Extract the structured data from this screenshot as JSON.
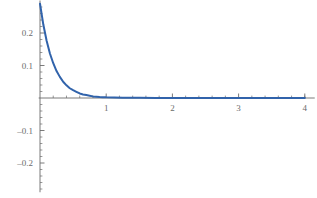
{
  "chart_data": {
    "type": "line",
    "title": "",
    "subtitle": "",
    "xlabel": "",
    "ylabel": "",
    "xlim": [
      -0.02,
      4.15
    ],
    "ylim": [
      -0.29,
      0.3
    ],
    "grid": false,
    "legend": null,
    "axis_style": "mathematica-crossed-axes",
    "series": [
      {
        "name": "exponential decay",
        "color": "#3163ab",
        "line_width": 2,
        "x": [
          0.0,
          0.05,
          0.1,
          0.15,
          0.2,
          0.25,
          0.3,
          0.35,
          0.4,
          0.45,
          0.5,
          0.55,
          0.6,
          0.65,
          0.7,
          0.75,
          0.8,
          0.85,
          0.9,
          0.95,
          1.0,
          1.25,
          1.5,
          1.75,
          2.0,
          2.25,
          2.5,
          2.75,
          3.0,
          3.25,
          3.5,
          3.75,
          4.0
        ],
        "y": [
          0.29,
          0.226,
          0.176,
          0.137,
          0.107,
          0.083,
          0.065,
          0.05,
          0.039,
          0.03,
          0.024,
          0.019,
          0.014,
          0.011,
          0.009,
          0.007,
          0.005,
          0.004,
          0.003,
          0.0025,
          0.002,
          0.001,
          0.0005,
          0.0002,
          0.0001,
          0.0001,
          0.0,
          0.0,
          0.0,
          0.0,
          0.0,
          0.0,
          0.0
        ]
      }
    ],
    "x_axis": {
      "major_ticks": [
        1,
        2,
        3,
        4
      ],
      "major_tick_labels": [
        "1",
        "2",
        "3",
        "4"
      ],
      "minor_ticks": [
        0.2,
        0.4,
        0.6,
        0.8,
        1.2,
        1.4,
        1.6,
        1.8,
        2.2,
        2.4,
        2.6,
        2.8,
        3.2,
        3.4,
        3.6,
        3.8,
        4.0
      ],
      "zero_label_shown": false
    },
    "y_axis": {
      "major_ticks": [
        -0.2,
        -0.1,
        0.1,
        0.2
      ],
      "major_tick_labels": [
        "-0.2",
        "-0.1",
        "0.1",
        "0.2"
      ],
      "minor_ticks": [
        -0.28,
        -0.26,
        -0.24,
        -0.22,
        -0.18,
        -0.16,
        -0.14,
        -0.12,
        -0.08,
        -0.06,
        -0.04,
        -0.02,
        0.02,
        0.04,
        0.06,
        0.08,
        0.12,
        0.14,
        0.16,
        0.18,
        0.22,
        0.24,
        0.26,
        0.28
      ],
      "zero_label_shown": false
    }
  },
  "colors": {
    "curve": "#3163ab",
    "axis": "#6b6b6b",
    "tick_label": "#6b6b6b",
    "background": "#ffffff"
  },
  "labels": {
    "y_02": "0.2",
    "y_01": "0.1",
    "y_m01": "-0.1",
    "y_m02": "-0.2",
    "x_1": "1",
    "x_2": "2",
    "x_3": "3",
    "x_4": "4"
  }
}
